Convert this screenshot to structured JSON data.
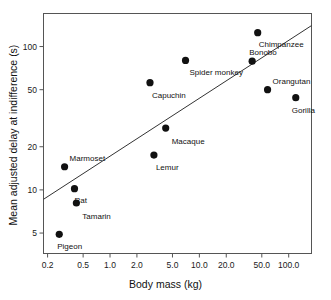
{
  "chart_data": {
    "type": "scatter",
    "title": "",
    "xlabel": "Body mass (kg)",
    "ylabel": "Mean adjusted delay at indifference (s)",
    "xscale": "log",
    "yscale": "log",
    "xlim": [
      0.18,
      180
    ],
    "ylim": [
      3.6,
      170
    ],
    "grid": false,
    "legend": "none",
    "xticks": [
      {
        "value": 0.2,
        "label": "0.2"
      },
      {
        "value": 0.5,
        "label": "0.5"
      },
      {
        "value": 1.0,
        "label": "1.0"
      },
      {
        "value": 2.0,
        "label": "2.0"
      },
      {
        "value": 5.0,
        "label": "5.0"
      },
      {
        "value": 10.0,
        "label": "10.0"
      },
      {
        "value": 20.0,
        "label": "20.0"
      },
      {
        "value": 50.0,
        "label": "50.0"
      },
      {
        "value": 100.0,
        "label": "100.0"
      }
    ],
    "yticks": [
      {
        "value": 5,
        "label": "5"
      },
      {
        "value": 10,
        "label": "10"
      },
      {
        "value": 20,
        "label": "20"
      },
      {
        "value": 50,
        "label": "50"
      },
      {
        "value": 100,
        "label": "100"
      }
    ],
    "points": [
      {
        "label": "Pigeon",
        "x": 0.27,
        "y": 4.9,
        "label_dx": -2,
        "label_dy": 13
      },
      {
        "label": "Marmoset",
        "x": 0.31,
        "y": 14.5,
        "label_dx": 5,
        "label_dy": -8
      },
      {
        "label": "Rat",
        "x": 0.4,
        "y": 10.2,
        "label_dx": 0,
        "label_dy": 12
      },
      {
        "label": "Tamarin",
        "x": 0.42,
        "y": 8.1,
        "label_dx": 6,
        "label_dy": 14
      },
      {
        "label": "Capuchin",
        "x": 2.8,
        "y": 56,
        "label_dx": 2,
        "label_dy": 13
      },
      {
        "label": "Lemur",
        "x": 3.1,
        "y": 17.5,
        "label_dx": 2,
        "label_dy": 13
      },
      {
        "label": "Macaque",
        "x": 4.2,
        "y": 27,
        "label_dx": 6,
        "label_dy": 14
      },
      {
        "label": "Spider monkey",
        "x": 7.0,
        "y": 80,
        "label_dx": 4,
        "label_dy": 13
      },
      {
        "label": "Bonobo",
        "x": 39,
        "y": 79,
        "label_dx": -3,
        "label_dy": -8
      },
      {
        "label": "Chimpanzee",
        "x": 45,
        "y": 125,
        "label_dx": 1,
        "label_dy": 12
      },
      {
        "label": "Orangutan",
        "x": 58,
        "y": 50,
        "label_dx": 5,
        "label_dy": -8
      },
      {
        "label": "Gorilla",
        "x": 120,
        "y": 44,
        "label_dx": -4,
        "label_dy": 13
      }
    ],
    "fit_line": {
      "type": "linear-log-log",
      "x_start": 0.18,
      "y_start": 8.6,
      "x_end": 180,
      "y_end": 140
    }
  },
  "figure": {
    "background_color": "#ffffff",
    "marker_color": "#111111",
    "axis_color": "#555555",
    "line_color": "#333333"
  }
}
